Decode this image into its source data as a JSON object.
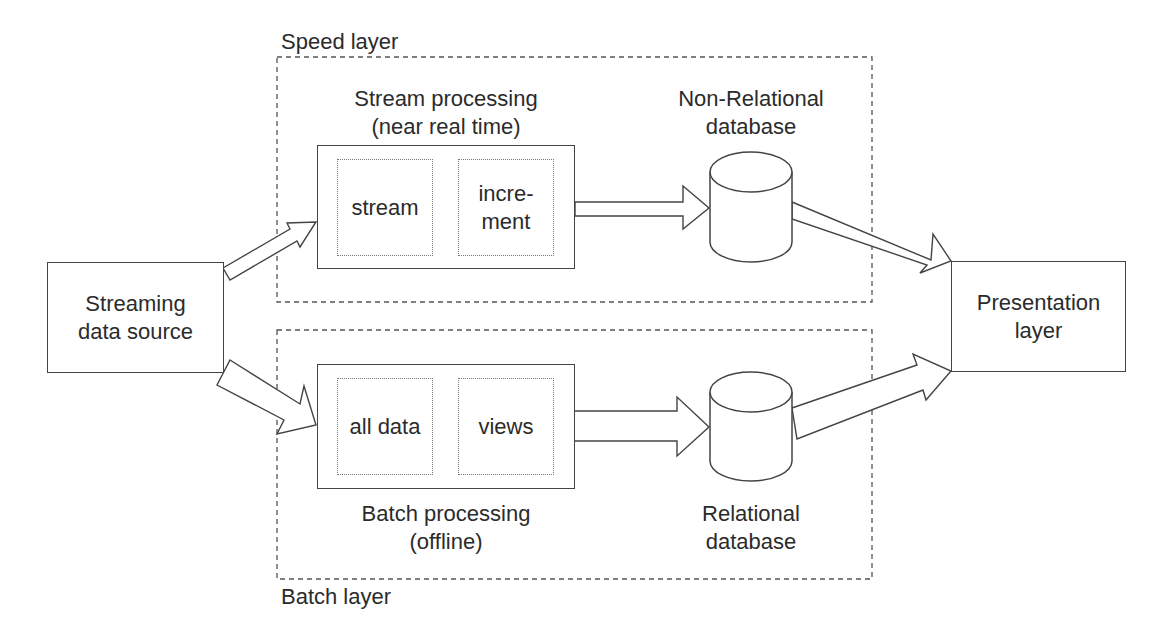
{
  "diagram": {
    "source": {
      "label": "Streaming\ndata source"
    },
    "presentation": {
      "label": "Presentation\nlayer"
    },
    "speed_layer": {
      "title": "Speed layer",
      "processing": {
        "title": "Stream processing\n(near real time)",
        "parts": [
          "stream",
          "incre-\nment"
        ]
      },
      "database": {
        "title": "Non-Relational\ndatabase"
      }
    },
    "batch_layer": {
      "title": "Batch layer",
      "processing": {
        "title": "Batch processing\n(offline)",
        "parts": [
          "all data",
          "views"
        ]
      },
      "database": {
        "title": "Relational\ndatabase"
      }
    }
  }
}
